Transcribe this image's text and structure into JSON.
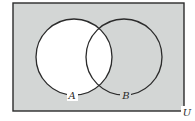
{
  "diagram": {
    "type": "venn",
    "shaded_region": "complement of A (A')",
    "colors": {
      "shade": "#d3d6d5",
      "unshaded": "#ffffff",
      "stroke": "#2b2b2b"
    },
    "universe": {
      "label": "U",
      "x": 13,
      "y": 3,
      "width": 171,
      "height": 108
    },
    "sets": [
      {
        "label": "A",
        "cx": 74,
        "cy": 57,
        "r": 38,
        "label_x": 72,
        "label_y": 99
      },
      {
        "label": "B",
        "cx": 124,
        "cy": 57,
        "r": 38,
        "label_x": 126,
        "label_y": 99
      }
    ],
    "universe_label_pos": {
      "x": 187,
      "y": 116
    }
  }
}
